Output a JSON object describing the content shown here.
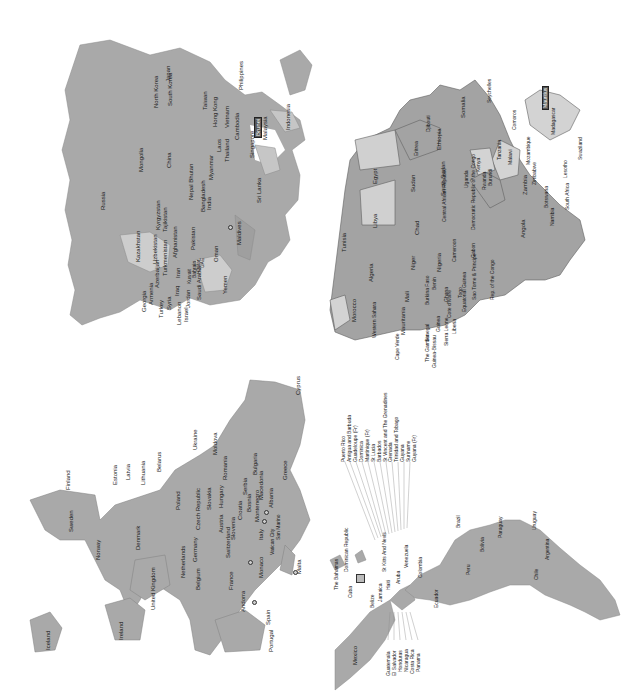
{
  "figure": {
    "orientation": "rotated-90-ccw",
    "colors": {
      "land_dark": "#a6a6a6",
      "land_medium": "#b2b2b2",
      "land_light": "#d3d3d3",
      "border": "#6e6e6e",
      "background": "#ffffff",
      "text": "#1a1a1a"
    }
  },
  "asia": {
    "labels": [
      "Russia",
      "Mongolia",
      "China",
      "Kazakhstan",
      "Uzbekistan",
      "Kyrgyzstan",
      "Tajikistan",
      "Turkmenistan",
      "Azerbaijan",
      "Armenia",
      "Georgia",
      "Turkey",
      "Syria",
      "Lebanon",
      "Israel",
      "Jordan",
      "Iraq",
      "Iran",
      "Kuwait",
      "Bahrain",
      "Qatar",
      "UAE",
      "Saudi Arabia",
      "Oman",
      "Yemen",
      "Afghanistan",
      "Pakistan",
      "India",
      "Nepal Bhutan",
      "Bangladesh",
      "Myanmar",
      "Laos",
      "Thailand",
      "Vietnam",
      "Cambodia",
      "Hong Kong",
      "Taiwan",
      "North Korea",
      "South Korea",
      "Japan",
      "Philippines",
      "Singapore",
      "Brunei",
      "Malaysia",
      "Indonesia",
      "Sri Lanka",
      "Maldives"
    ]
  },
  "africa": {
    "labels": [
      "Morocco",
      "Tunisia",
      "Algeria",
      "Libya",
      "Egypt",
      "Western Sahara",
      "Mauritania",
      "Mali",
      "Niger",
      "Chad",
      "Sudan",
      "Eritrea",
      "Djibouti",
      "Ethiopia",
      "Somalia",
      "South Sudan",
      "Central African Republic",
      "Senegal",
      "The Gambia",
      "Guinea-Bissau",
      "Guinea",
      "Sierra Leone",
      "Liberia",
      "Cote d'Ivoire",
      "Burkina Faso",
      "Ghana",
      "Togo",
      "Benin",
      "Nigeria",
      "Cameroon",
      "Equatorial Guinea",
      "Sao Tome & Principe",
      "Gabon",
      "Rep. of the Congo",
      "Democratic Republic of the Congo",
      "Uganda",
      "Kenya",
      "Rwanda",
      "Burundi",
      "Tanzania",
      "Angola",
      "Zambia",
      "Malawi",
      "Mozambique",
      "Zimbabwe",
      "Namibia",
      "Botswana",
      "South Africa",
      "Lesotho",
      "Swaziland",
      "Madagascar",
      "Comoros",
      "Seychelles",
      "Mauritius",
      "Cape Verde"
    ],
    "highlighted": "Mauritius"
  },
  "europe": {
    "labels": [
      "Iceland",
      "Ireland",
      "United Kingdom",
      "Norway",
      "Sweden",
      "Finland",
      "Denmark",
      "Estonia",
      "Latvia",
      "Lithuania",
      "Belarus",
      "Ukraine",
      "Moldova",
      "Poland",
      "Germany",
      "Netherlands",
      "Belgium",
      "France",
      "Switzerland",
      "Czech Republic",
      "Slovakia",
      "Austria",
      "Hungary",
      "Slovenia",
      "Croatia",
      "Bosnia",
      "Serbia",
      "Montenegro",
      "Macedonia",
      "Albania",
      "Romania",
      "Bulgaria",
      "Greece",
      "Italy",
      "Vatican City",
      "San Marino",
      "Monaco",
      "Andorra",
      "Spain",
      "Portugal",
      "Malta",
      "Cyprus"
    ]
  },
  "americas": {
    "labels": [
      "Mexico",
      "Guatemala",
      "El Salvador",
      "Honduras",
      "Nicaragua",
      "Costa Rica",
      "Panama",
      "Belize",
      "Cuba",
      "The Bahamas",
      "Jamaica",
      "Haiti",
      "Dominican Republic",
      "St Kitts And Nevis",
      "Aruba",
      "Puerto Rico",
      "Antigua and Barbuda",
      "Guadeloupe (Fr)",
      "Dominica",
      "Martinique (Fr)",
      "St Lucia",
      "Barbados",
      "St Vincent and The Grenadines",
      "Grenada",
      "Trinidad and Tobago",
      "Guyana",
      "Suriname",
      "Guyana (Fr)",
      "Venezuela",
      "Colombia",
      "Ecuador",
      "Peru",
      "Brazil",
      "Bolivia",
      "Paraguay",
      "Chile",
      "Argentina",
      "Uruguay"
    ]
  }
}
